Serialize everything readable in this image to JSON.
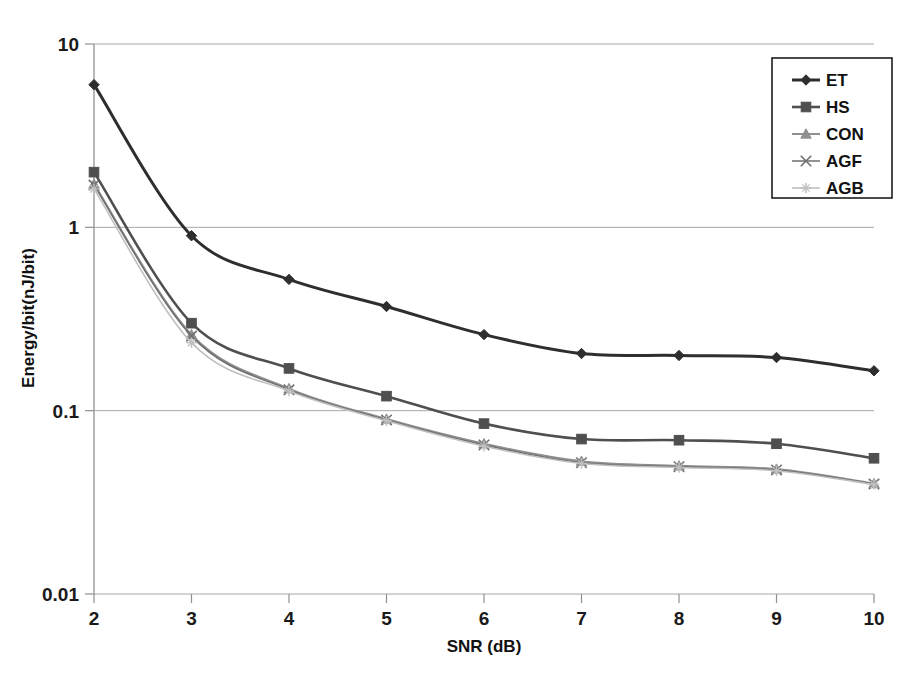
{
  "chart_data": {
    "type": "line",
    "title": "",
    "xlabel": "SNR (dB)",
    "ylabel": "Energy/bit(nJ/bit)",
    "x": [
      2,
      3,
      4,
      5,
      6,
      7,
      8,
      9,
      10
    ],
    "xticklabels": [
      "2",
      "3",
      "4",
      "5",
      "6",
      "7",
      "8",
      "9",
      "10"
    ],
    "yticklabels": [
      "10",
      "1",
      "0.1",
      "0.01"
    ],
    "ytickvalues": [
      10,
      1,
      0.1,
      0.01
    ],
    "yscale": "log",
    "ylim": [
      0.01,
      10
    ],
    "xlim": [
      2,
      10
    ],
    "grid": "horizontal",
    "legend_position": "top-right",
    "series": [
      {
        "name": "ET",
        "marker": "diamond",
        "color": "#2e2e2e",
        "values": [
          6.0,
          0.9,
          0.52,
          0.37,
          0.26,
          0.205,
          0.2,
          0.195,
          0.165
        ]
      },
      {
        "name": "HS",
        "marker": "square",
        "color": "#4f4f4f",
        "values": [
          2.0,
          0.3,
          0.17,
          0.12,
          0.085,
          0.07,
          0.069,
          0.066,
          0.055
        ]
      },
      {
        "name": "CON",
        "marker": "triangle",
        "color": "#8f8f8f",
        "values": [
          1.72,
          0.26,
          0.132,
          0.09,
          0.066,
          0.053,
          0.05,
          0.048,
          0.04
        ]
      },
      {
        "name": "AGF",
        "marker": "x",
        "color": "#6e6e6e",
        "values": [
          1.7,
          0.255,
          0.13,
          0.089,
          0.065,
          0.052,
          0.0495,
          0.0475,
          0.0398
        ]
      },
      {
        "name": "AGB",
        "marker": "star",
        "color": "#c0c0c0",
        "values": [
          1.62,
          0.235,
          0.128,
          0.088,
          0.064,
          0.0515,
          0.049,
          0.047,
          0.0395
        ]
      }
    ]
  },
  "legend": {
    "items": [
      {
        "label": "ET"
      },
      {
        "label": "HS"
      },
      {
        "label": "CON"
      },
      {
        "label": "AGF"
      },
      {
        "label": "AGB"
      }
    ]
  },
  "axes": {
    "x_title": "SNR (dB)",
    "y_title": "Energy/bit(nJ/bit)"
  }
}
